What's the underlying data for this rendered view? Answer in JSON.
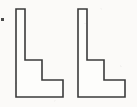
{
  "figure": {
    "background_color": "#fbfaf8",
    "stroke_color": "#3b3b3b",
    "fill_color": "#fdfdfb",
    "stroke_width": 1.6,
    "canvas": {
      "width": 137,
      "height": 107
    },
    "shapes": [
      {
        "name": "l-shape-left",
        "label": "",
        "points": "16,9 25,9 25,60 42,60 42,80 63,80 63,97 16,97"
      },
      {
        "name": "l-shape-right",
        "label": "",
        "points": "78,9 87,9 87,60 104,60 104,80 125,80 125,97 78,97"
      }
    ],
    "marks": [
      {
        "name": "left-edge-dot",
        "x": 1,
        "y": 18,
        "width": 3,
        "height": 3,
        "color": "#4a4a4a"
      }
    ]
  }
}
